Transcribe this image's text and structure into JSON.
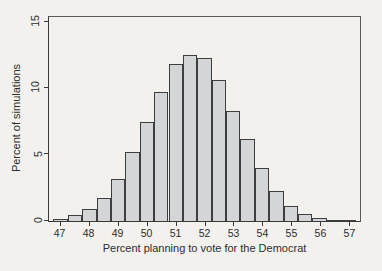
{
  "figure": {
    "xlabel": "Percent planning to vote for the Democrat",
    "ylabel": "Percent of simulations"
  },
  "chart_data": {
    "type": "bar",
    "subtype": "histogram",
    "title": "",
    "xlabel": "Percent planning to vote for the Democrat",
    "ylabel": "Percent of simulations",
    "bin_width": 0.5,
    "bin_centers": [
      47.0,
      47.5,
      48.0,
      48.5,
      49.0,
      49.5,
      50.0,
      50.5,
      51.0,
      51.5,
      52.0,
      52.5,
      53.0,
      53.5,
      54.0,
      54.5,
      55.0,
      55.5,
      56.0,
      56.5,
      57.0
    ],
    "values": [
      0.15,
      0.45,
      0.9,
      1.7,
      3.2,
      5.2,
      7.5,
      9.7,
      11.8,
      12.5,
      12.3,
      10.6,
      8.3,
      6.2,
      4.0,
      2.3,
      1.1,
      0.5,
      0.2,
      0.1,
      0.05
    ],
    "x_ticks": [
      47,
      48,
      49,
      50,
      51,
      52,
      53,
      54,
      55,
      56,
      57
    ],
    "y_ticks": [
      0,
      5,
      10,
      15
    ],
    "xlim": [
      46.6,
      57.4
    ],
    "ylim": [
      0,
      15
    ],
    "grid": false,
    "legend": "none",
    "bar_fill": "#d3d5d7",
    "bar_border": "#3c3e40",
    "background": "#f2f1ee"
  }
}
